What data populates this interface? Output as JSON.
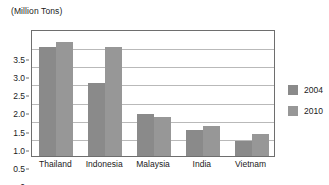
{
  "chart_data": {
    "type": "bar",
    "title": "",
    "ylabel": "(Million Tons)",
    "xlabel": "",
    "categories": [
      "Thailand",
      "Indonesia",
      "Malaysia",
      "India",
      "Vietnam"
    ],
    "series": [
      {
        "name": "2004",
        "color": "#8a8a8a",
        "values": [
          3.0,
          2.0,
          1.15,
          0.72,
          0.42
        ]
      },
      {
        "name": "2010",
        "color": "#979797",
        "values": [
          3.15,
          3.0,
          1.07,
          0.83,
          0.62
        ]
      }
    ],
    "ylim": [
      0,
      3.5
    ],
    "yticks": [
      "3.5",
      "3.0",
      "2.5",
      "2.0",
      "1.5",
      "1.0",
      "0.5",
      "0"
    ],
    "ytick_values": [
      3.5,
      3.0,
      2.5,
      2.0,
      1.5,
      1.0,
      0.5,
      0
    ],
    "grid": true,
    "legend_position": "right",
    "legend": [
      "2004",
      "2010"
    ]
  }
}
